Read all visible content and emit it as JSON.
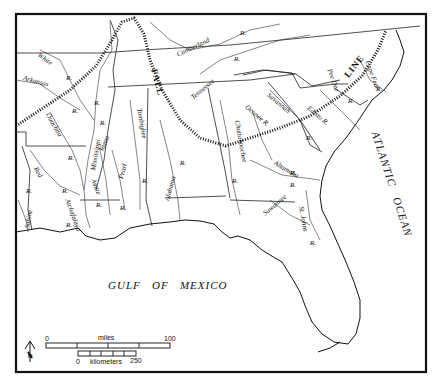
{
  "map": {
    "water_bodies": {
      "gulf": "GULF   OF   MEXICO",
      "ocean": "ATLANTIC   OCEAN"
    },
    "fall_line": {
      "label_fall": "FALL",
      "label_line": "LINE"
    },
    "rivers": {
      "white": "White",
      "white_r": "R.",
      "arkansas": "Arkansas",
      "arkansas_r": "R.",
      "ouachita": "Ouachita",
      "ouachita_r": "R.",
      "mississippi": "Mississippi",
      "mississippi_r": "R.",
      "yazoo": "Yazoo",
      "yazoo_r": "R.",
      "red": "Red",
      "red_r": "R.",
      "sabine": "Sabine",
      "sabine_r": "R.",
      "atchafalaya": "Atchafalaya",
      "atchafalaya_r": "R.",
      "amite": "Amite",
      "amite_r": "R.",
      "pearl": "Pearl",
      "pearl_r": "R.",
      "tombigbee": "Tombigbee",
      "tombigbee_r": "R.",
      "alabama": "Alabama",
      "alabama_r": "R.",
      "chattahoochee": "Chattahoochee",
      "chattahoochee_r": "R.",
      "tennessee": "Tennessee",
      "tennessee_r": "R.",
      "cumberland": "Cumberland",
      "cumberland_r": "R.",
      "oconee": "Oconee R.",
      "savannah": "Savannah",
      "savannah_r": "R.",
      "edisto": "Edisto R.",
      "pee_dee": "Pee Dee",
      "pee_dee_r": "R.",
      "cape_fear": "Cape Fear",
      "cape_fear_r": "R.",
      "altamaha": "Altamaha",
      "altamaha_r": "R.",
      "suwannee": "Suwannee",
      "suwannee_r": "R.",
      "st_johns": "St. Johns",
      "st_johns_r": "R."
    },
    "scale_bar": {
      "miles_label": "miles",
      "miles_start": "0",
      "miles_end": "100",
      "km_label": "kilometers",
      "km_start": "0",
      "km_end": "250"
    },
    "north_arrow": "N",
    "colors": {
      "ink": "#111111",
      "paper": "#ffffff"
    }
  }
}
